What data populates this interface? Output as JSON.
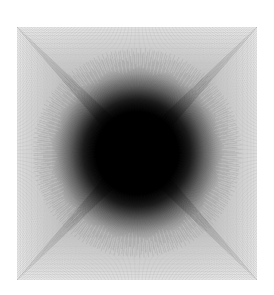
{
  "figure": {
    "title": "",
    "background_color": "#ffffff",
    "width": 274,
    "height": 295
  },
  "chart_data": {
    "type": "line",
    "title": "",
    "subtitle": "",
    "xlabel": "",
    "ylabel": "",
    "grid": false,
    "legend": null,
    "axis_visible": false,
    "tick_labels_x": [],
    "tick_labels_y": [],
    "line_color": "#000000",
    "line_width": 0.35,
    "background_color": "#ffffff",
    "plot_area": {
      "left": 17,
      "top": 27,
      "right": 257,
      "bottom": 280,
      "width": 240,
      "height": 253
    },
    "center": {
      "x": 137,
      "y": 153
    },
    "core": {
      "radius": 48,
      "color": "#000000",
      "falloff_radius": 86
    },
    "xlim": [
      0,
      240
    ],
    "ylim": [
      0,
      253
    ],
    "series": [
      {
        "name": "boundary-grid-vertical",
        "kind": "vertical-fan",
        "count": 168,
        "values": []
      },
      {
        "name": "boundary-grid-horizontal",
        "kind": "horizontal-fan",
        "count": 176,
        "values": []
      },
      {
        "name": "radial-spokes",
        "kind": "radial",
        "count": 720,
        "values": []
      },
      {
        "name": "nested-squares",
        "kind": "concentric-square",
        "count": 120,
        "values": []
      }
    ],
    "moire_bands": [
      {
        "level": 1,
        "inset": 0
      },
      {
        "level": 2,
        "inset": 22
      },
      {
        "level": 3,
        "inset": 44
      },
      {
        "level": 4,
        "inset": 66
      },
      {
        "level": 5,
        "inset": 88
      }
    ]
  }
}
